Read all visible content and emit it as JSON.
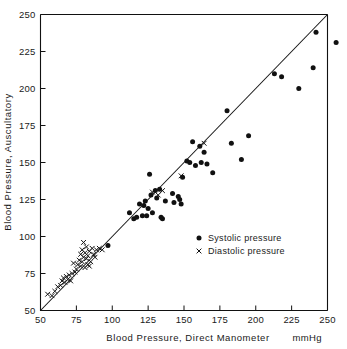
{
  "chart_data": {
    "type": "scatter",
    "title": "",
    "xlabel": "Blood Pressure, Direct Manometer",
    "ylabel": "Blood Pressure, Auscultatory",
    "units": "mmHg",
    "xlim": [
      50,
      250
    ],
    "ylim": [
      50,
      250
    ],
    "xticks": [
      50,
      75,
      100,
      125,
      150,
      175,
      200,
      225,
      250
    ],
    "yticks": [
      50,
      75,
      100,
      125,
      150,
      175,
      200,
      225,
      250
    ],
    "xtick_labels": [
      "50",
      "75",
      "100",
      "125",
      "150",
      "175",
      "200",
      "225",
      "250"
    ],
    "ytick_labels": [
      "50",
      "75",
      "100",
      "125",
      "150",
      "175",
      "200",
      "225",
      "250"
    ],
    "grid": false,
    "legend_position": "center-right",
    "reference_line": {
      "name": "line-of-identity",
      "from": [
        50,
        50
      ],
      "to": [
        250,
        250
      ]
    },
    "series": [
      {
        "name": "Systolic pressure",
        "marker": "filled-circle",
        "color": "#111111",
        "points": [
          [
            97,
            94
          ],
          [
            112,
            116
          ],
          [
            115,
            112
          ],
          [
            117,
            113
          ],
          [
            119,
            122
          ],
          [
            121,
            114
          ],
          [
            122,
            121
          ],
          [
            123,
            124
          ],
          [
            124,
            114
          ],
          [
            125,
            119
          ],
          [
            126,
            142
          ],
          [
            127,
            128
          ],
          [
            128,
            116
          ],
          [
            130,
            131
          ],
          [
            131,
            126
          ],
          [
            133,
            132
          ],
          [
            134,
            113
          ],
          [
            135,
            112
          ],
          [
            137,
            124
          ],
          [
            142,
            129
          ],
          [
            143,
            123
          ],
          [
            146,
            127
          ],
          [
            147,
            125
          ],
          [
            148,
            122
          ],
          [
            149,
            140
          ],
          [
            152,
            151
          ],
          [
            154,
            150
          ],
          [
            156,
            164
          ],
          [
            158,
            148
          ],
          [
            161,
            161
          ],
          [
            162,
            150
          ],
          [
            164,
            157
          ],
          [
            166,
            149
          ],
          [
            170,
            143
          ],
          [
            180,
            185
          ],
          [
            183,
            163
          ],
          [
            190,
            152
          ],
          [
            195,
            168
          ],
          [
            213,
            210
          ],
          [
            218,
            208
          ],
          [
            230,
            200
          ],
          [
            240,
            214
          ],
          [
            242,
            238
          ],
          [
            256,
            231
          ]
        ]
      },
      {
        "name": "Diastolic pressure",
        "marker": "cross",
        "color": "#111111",
        "points": [
          [
            55,
            61
          ],
          [
            58,
            60
          ],
          [
            60,
            63
          ],
          [
            62,
            66
          ],
          [
            64,
            67
          ],
          [
            65,
            70
          ],
          [
            66,
            72
          ],
          [
            67,
            69
          ],
          [
            68,
            73
          ],
          [
            69,
            71
          ],
          [
            70,
            74
          ],
          [
            71,
            70
          ],
          [
            72,
            75
          ],
          [
            73,
            82
          ],
          [
            74,
            76
          ],
          [
            75,
            78
          ],
          [
            76,
            81
          ],
          [
            77,
            84
          ],
          [
            78,
            80
          ],
          [
            78,
            88
          ],
          [
            79,
            83
          ],
          [
            79,
            91
          ],
          [
            80,
            86
          ],
          [
            80,
            96
          ],
          [
            81,
            79
          ],
          [
            81,
            89
          ],
          [
            82,
            85
          ],
          [
            82,
            93
          ],
          [
            83,
            81
          ],
          [
            83,
            87
          ],
          [
            84,
            80
          ],
          [
            84,
            90
          ],
          [
            85,
            83
          ],
          [
            86,
            92
          ],
          [
            87,
            88
          ],
          [
            88,
            86
          ],
          [
            89,
            91
          ],
          [
            91,
            92
          ],
          [
            93,
            91
          ],
          [
            128,
            130
          ],
          [
            132,
            128
          ],
          [
            135,
            131
          ],
          [
            148,
            141
          ],
          [
            164,
            163
          ]
        ]
      }
    ],
    "legend": [
      {
        "marker": "filled-circle",
        "label": "Systolic pressure"
      },
      {
        "marker": "cross",
        "label": "Diastolic pressure"
      }
    ]
  }
}
